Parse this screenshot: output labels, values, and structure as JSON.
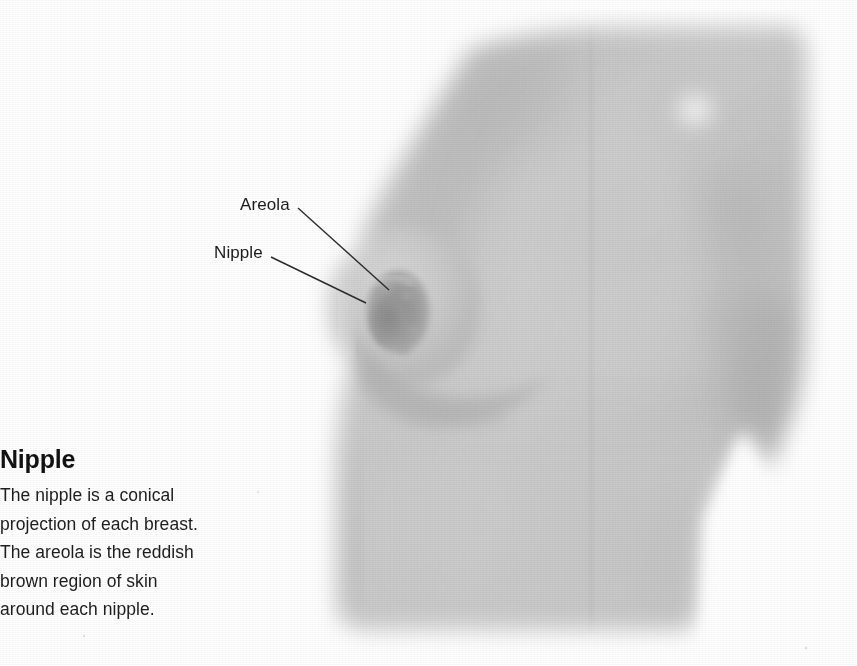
{
  "figure": {
    "kind": "anatomy-photograph",
    "caption": {
      "heading": "Nipple",
      "lines": [
        "The nipple is a conical",
        "projection of each breast.",
        "The areola is the reddish",
        "brown region of skin",
        "around each nipple."
      ],
      "text": "The nipple is a conical projection of each breast. The areola is the reddish brown region of skin around each nipple."
    },
    "callouts": [
      {
        "id": "areola",
        "label": "Areola",
        "label_x": 240,
        "label_y": 195,
        "leader_from_x": 298,
        "leader_from_y": 208,
        "leader_to_x": 389,
        "leader_to_y": 290
      },
      {
        "id": "nipple",
        "label": "Nipple",
        "label_x": 214,
        "label_y": 243,
        "leader_from_x": 271,
        "leader_from_y": 257,
        "leader_to_x": 366,
        "leader_to_y": 303
      }
    ],
    "colors": {
      "page_background": "#ffffff",
      "skin_light": "#d6d6d6",
      "skin_mid": "#c5c5c5",
      "skin_shadow": "#b4b4b4",
      "skin_deep_shadow": "#a6a6a6",
      "areola_dark": "#9a9a9a",
      "highlight": "#f0f0f0",
      "leader_line": "#2b2b2b",
      "label_text": "#1b1b1b",
      "heading_text": "#121212",
      "body_text": "#1d1d1d"
    },
    "geometry": {
      "width": 857,
      "height": 666,
      "photo_left": 300,
      "photo_top": 25,
      "photo_right": 812,
      "photo_bottom": 634,
      "areola_center_x": 398,
      "areola_center_y": 311,
      "areola_rx": 30,
      "areola_ry": 40,
      "highlight_x": 695,
      "highlight_y": 110,
      "highlight_r": 26
    }
  }
}
